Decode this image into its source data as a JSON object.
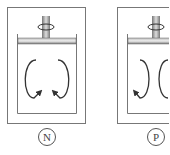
{
  "panels": [
    {
      "id": "N",
      "label": "N",
      "flow": "outward-down"
    },
    {
      "id": "P",
      "label": "P",
      "flow": "inward-down"
    }
  ],
  "colors": {
    "stroke": "#666666",
    "arrow": "#333333",
    "shaft": "#888888"
  }
}
